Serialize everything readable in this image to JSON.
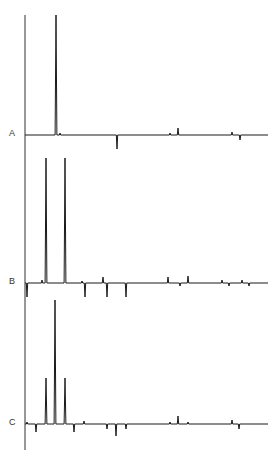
{
  "figure": {
    "labels": [
      "A",
      "B",
      "C"
    ],
    "line_color": "#1a1a1a",
    "label_color": "#333333"
  },
  "chart_data": {
    "type": "line",
    "title": "",
    "xlabel": "",
    "ylabel": "",
    "grid": false,
    "legend": "none",
    "series": [
      {
        "name": "A",
        "baseline_y": 135,
        "peaks": [
          {
            "x": 56,
            "height": 120
          },
          {
            "x": 60,
            "height": 2
          },
          {
            "x": 117,
            "height": -14
          },
          {
            "x": 170,
            "height": 2
          },
          {
            "x": 178,
            "height": 7
          },
          {
            "x": 232,
            "height": 3
          },
          {
            "x": 240,
            "height": -5
          }
        ]
      },
      {
        "name": "B",
        "baseline_y": 283,
        "peaks": [
          {
            "x": 27,
            "height": -14
          },
          {
            "x": 42,
            "height": 3
          },
          {
            "x": 46,
            "height": 125
          },
          {
            "x": 65,
            "height": 125
          },
          {
            "x": 82,
            "height": 2
          },
          {
            "x": 85,
            "height": -14
          },
          {
            "x": 103,
            "height": 6
          },
          {
            "x": 107,
            "height": -14
          },
          {
            "x": 126,
            "height": -14
          },
          {
            "x": 168,
            "height": 6
          },
          {
            "x": 180,
            "height": -3
          },
          {
            "x": 188,
            "height": 7
          },
          {
            "x": 222,
            "height": 3
          },
          {
            "x": 229,
            "height": -3
          },
          {
            "x": 242,
            "height": 3
          },
          {
            "x": 249,
            "height": -3
          }
        ]
      },
      {
        "name": "C",
        "baseline_y": 424,
        "peaks": [
          {
            "x": 27,
            "height": 2
          },
          {
            "x": 36,
            "height": -8
          },
          {
            "x": 46,
            "height": 46
          },
          {
            "x": 55,
            "height": 124
          },
          {
            "x": 65,
            "height": 46
          },
          {
            "x": 74,
            "height": -8
          },
          {
            "x": 84,
            "height": 3
          },
          {
            "x": 107,
            "height": -5
          },
          {
            "x": 116,
            "height": -12
          },
          {
            "x": 126,
            "height": -5
          },
          {
            "x": 170,
            "height": 2
          },
          {
            "x": 178,
            "height": 8
          },
          {
            "x": 188,
            "height": 2
          },
          {
            "x": 232,
            "height": 4
          },
          {
            "x": 239,
            "height": -5
          }
        ]
      }
    ],
    "axis": {
      "x": 25,
      "y_top": 15,
      "y_bottom": 450
    },
    "x_range": [
      25,
      268
    ]
  }
}
